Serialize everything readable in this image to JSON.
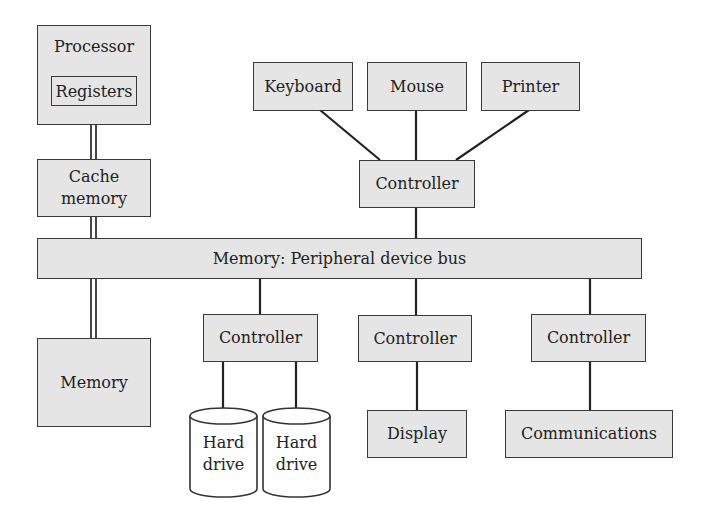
{
  "diagram": {
    "processor": {
      "label": "Processor",
      "registers": "Registers"
    },
    "cache": {
      "line1": "Cache",
      "line2": "memory"
    },
    "memory": {
      "label": "Memory"
    },
    "bus": {
      "label": "Memory: Peripheral device bus"
    },
    "input_devices": [
      {
        "label": "Keyboard"
      },
      {
        "label": "Mouse"
      },
      {
        "label": "Printer"
      }
    ],
    "controllers": {
      "input": "Controller",
      "storage": "Controller",
      "display": "Controller",
      "comm": "Controller"
    },
    "storage": [
      {
        "line1": "Hard",
        "line2": "drive"
      },
      {
        "line1": "Hard",
        "line2": "drive"
      }
    ],
    "display": {
      "label": "Display"
    },
    "communications": {
      "label": "Communications"
    },
    "colors": {
      "box_fill": "#e5e5e5",
      "stroke": "#3a3a3a",
      "cylinder_fill": "#ffffff"
    }
  }
}
